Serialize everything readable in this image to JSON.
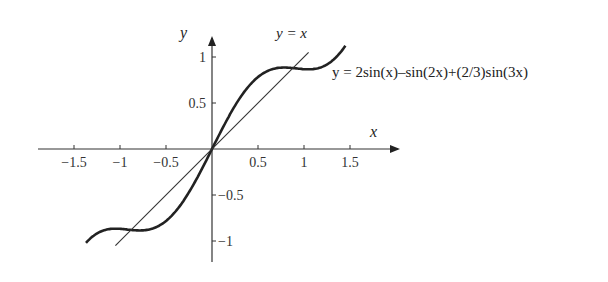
{
  "chart_data": {
    "type": "line",
    "title": "",
    "xlabel": "x",
    "ylabel": "y",
    "xlim": [
      -1.9,
      2.0
    ],
    "ylim": [
      -1.2,
      1.25
    ],
    "grid": false,
    "x_ticks": [
      "-1.5",
      "-1",
      "-0.5",
      "0.5",
      "1",
      "1.5"
    ],
    "x_tick_values": [
      -1.5,
      -1,
      -0.5,
      0.5,
      1,
      1.5
    ],
    "y_ticks": [
      "1",
      "0.5",
      "-0.5",
      "-1"
    ],
    "y_tick_values": [
      1,
      0.5,
      -0.5,
      -1
    ],
    "series": [
      {
        "name": "y = 2sin(x)−sin(2x)+(2/3)sin(3x)",
        "label": "y = 2sin(x)–sin(2x)+(2/3)sin(3x)",
        "style": "thick",
        "x": [
          -1.37,
          -1.2,
          -1.0,
          -0.8,
          -0.6,
          -0.4,
          -0.2,
          0,
          0.2,
          0.4,
          0.6,
          0.8,
          1.0,
          1.2,
          1.45
        ],
        "values": [
          -1.16,
          -0.92,
          -0.85,
          -0.87,
          -0.81,
          -0.62,
          -0.34,
          0,
          0.34,
          0.62,
          0.81,
          0.87,
          0.85,
          0.92,
          1.2
        ]
      },
      {
        "name": "y = x",
        "label": "y = x",
        "style": "thin",
        "x": [
          -1.05,
          1.05
        ],
        "values": [
          -1.05,
          1.05
        ]
      }
    ]
  }
}
